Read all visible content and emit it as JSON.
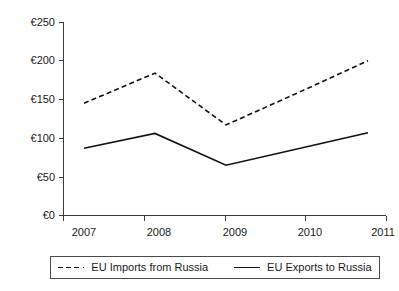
{
  "chart_data": {
    "type": "line",
    "title": "",
    "xlabel": "",
    "ylabel": "",
    "categories": [
      "2007",
      "2008",
      "2009",
      "2010",
      "2011"
    ],
    "series": [
      {
        "name": "EU Imports from Russia",
        "style": "dashed",
        "values": [
          145,
          184,
          117,
          158,
          200
        ]
      },
      {
        "name": "EU Exports to Russia",
        "style": "solid",
        "values": [
          87,
          106,
          65,
          86,
          107
        ]
      }
    ],
    "ylim": [
      0,
      250
    ],
    "ytick_values": [
      0,
      50,
      100,
      150,
      200,
      250
    ],
    "ytick_labels": [
      "€0",
      "€50",
      "€100",
      "€150",
      "€200",
      "€250"
    ],
    "grid": false,
    "legend_position": "bottom",
    "currency_symbol": "€",
    "line_color": "#111111"
  },
  "axis": {
    "y_labels": [
      "€250",
      "€200",
      "€150",
      "€100",
      "€50",
      "€0"
    ],
    "x_labels": [
      "2007",
      "2008",
      "2009",
      "2010",
      "2011"
    ]
  },
  "legend": {
    "imports_label": "EU Imports from Russia",
    "exports_label": "EU Exports to Russia"
  },
  "clipped_title": ""
}
